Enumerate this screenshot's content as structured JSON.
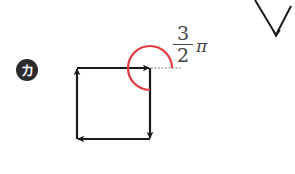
{
  "figure": {
    "label_badge": "カ",
    "angle_label": {
      "numerator": "3",
      "denominator": "2",
      "symbol": "π",
      "value_text": "3/2 π"
    },
    "square_path_direction": "right → down → left → up",
    "colors": {
      "stroke": "#1a1a1a",
      "arc": "#e0383b",
      "badge_bg": "#2b2b2b",
      "badge_text": "#ffffff"
    },
    "arc_angle_radians": "3π/2"
  }
}
